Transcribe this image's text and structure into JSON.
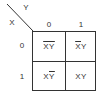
{
  "diagram": {
    "type": "karnaugh-map",
    "row_variable": "X",
    "col_variable": "Y",
    "col_headers": [
      "0",
      "1"
    ],
    "row_headers": [
      "0",
      "1"
    ],
    "cells": [
      [
        {
          "x": "X",
          "x_bar": true,
          "y": "Y",
          "y_bar": true
        },
        {
          "x": "X",
          "x_bar": true,
          "y": "Y",
          "y_bar": false
        }
      ],
      [
        {
          "x": "X",
          "x_bar": false,
          "y": "Y",
          "y_bar": true
        },
        {
          "x": "X",
          "x_bar": false,
          "y": "Y",
          "y_bar": false
        }
      ]
    ],
    "cell_text": [
      [
        "X̄Ȳ",
        "X̄Y"
      ],
      [
        "XȲ",
        "XY"
      ]
    ]
  }
}
